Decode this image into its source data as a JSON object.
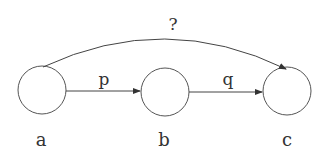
{
  "diagram": {
    "nodes": [
      {
        "id": "a",
        "label": "a",
        "cx": 42,
        "cy": 90,
        "r": 24
      },
      {
        "id": "b",
        "label": "b",
        "cx": 165,
        "cy": 92,
        "r": 24
      },
      {
        "id": "c",
        "label": "c",
        "cx": 287,
        "cy": 91,
        "r": 24
      }
    ],
    "edges": [
      {
        "from": "a",
        "to": "b",
        "label": "p"
      },
      {
        "from": "b",
        "to": "c",
        "label": "q"
      },
      {
        "from": "a",
        "to": "c",
        "label": "?"
      }
    ],
    "colors": {
      "stroke": "#444444",
      "text": "#333333",
      "background": "#ffffff"
    }
  }
}
